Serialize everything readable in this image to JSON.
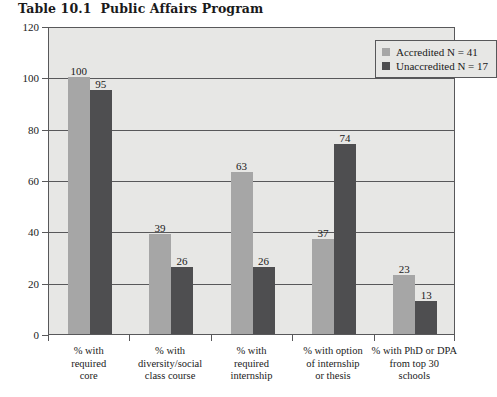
{
  "title": {
    "number": "Table 10.1",
    "text": "Public Affairs Program"
  },
  "chart_data": {
    "type": "bar",
    "xlabel": "",
    "ylabel": "",
    "ylim": [
      0,
      120
    ],
    "yticks": [
      0,
      20,
      40,
      60,
      80,
      100,
      120
    ],
    "grid": true,
    "legend_position": "top-right",
    "categories": [
      "% with required core",
      "% with diversity/social class course",
      "% with required internship",
      "% with option of internship or thesis",
      "% with PhD or DPA from top 30 schools"
    ],
    "category_lines": [
      [
        "% with",
        "required",
        "core"
      ],
      [
        "% with",
        "diversity/social",
        "class course"
      ],
      [
        "% with",
        "required",
        "internship"
      ],
      [
        "% with option",
        "of internship",
        "or thesis"
      ],
      [
        "% with PhD or DPA",
        "from top 30",
        "schools"
      ]
    ],
    "series": [
      {
        "name": "Accredited N = 41",
        "color": "#a6a6a6",
        "values": [
          100,
          39,
          63,
          37,
          23
        ]
      },
      {
        "name": "Unaccredited N = 17",
        "color": "#4e4e50",
        "values": [
          95,
          26,
          26,
          74,
          13
        ]
      }
    ]
  },
  "legend": {
    "items": [
      {
        "label": "Accredited N = 41",
        "color": "#a6a6a6"
      },
      {
        "label": "Unaccredited N = 17",
        "color": "#4e4e50"
      }
    ]
  },
  "axis": {
    "y_tick_labels": [
      "0",
      "20",
      "40",
      "60",
      "80",
      "100",
      "120"
    ]
  },
  "colors": {
    "accredited": "#a6a6a6",
    "unaccredited": "#4e4e50",
    "plot_background": "#e7e7e5",
    "axis_line": "#58585a",
    "page_background": "#ffffff"
  }
}
